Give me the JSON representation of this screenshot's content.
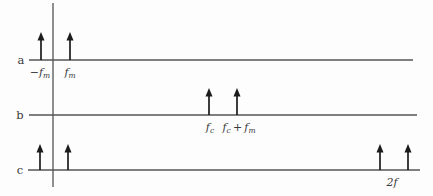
{
  "figure": {
    "width": 433,
    "height": 196,
    "background": "#fdfdfd",
    "colors": {
      "axis": "#545454",
      "arrow": "#1c1c1c",
      "text": "#3a3a3a"
    },
    "vertical_axis": {
      "x": 53,
      "y1": 3,
      "y2": 187
    },
    "rows": [
      {
        "label": "a",
        "label_x": 21,
        "line_y": 60,
        "line_x1": 29,
        "line_x2": 413,
        "arrow_tip_y": 32,
        "impulses": [
          {
            "x": 41,
            "label": "−f_m",
            "label_x": 40,
            "label_y": 76
          },
          {
            "x": 70,
            "label": "f_m",
            "label_x": 70,
            "label_y": 76
          }
        ]
      },
      {
        "label": "b",
        "label_x": 20,
        "line_y": 115,
        "line_x1": 29,
        "line_x2": 417,
        "arrow_tip_y": 88,
        "impulses": [
          {
            "x": 209,
            "label": "f_c",
            "label_x": 210,
            "label_y": 131
          },
          {
            "x": 237,
            "label": "f_c + f_m",
            "label_x": 239,
            "label_y": 131
          }
        ]
      },
      {
        "label": "c",
        "label_x": 20,
        "line_y": 170,
        "line_x1": 28,
        "line_x2": 420,
        "arrow_tip_y": 144,
        "impulses": [
          {
            "x": 40
          },
          {
            "x": 68
          },
          {
            "x": 380
          },
          {
            "x": 408,
            "label": "2f",
            "label_x": 392,
            "label_y": 186
          }
        ]
      }
    ]
  }
}
